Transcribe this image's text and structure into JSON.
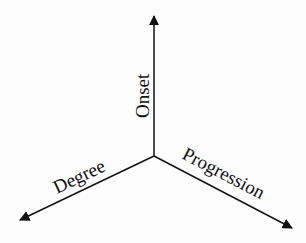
{
  "diagram": {
    "type": "three-axis-diagram",
    "center": {
      "x": 154,
      "y": 156
    },
    "axes": [
      {
        "label": "Onset",
        "direction": "up",
        "tip": {
          "x": 154,
          "y": 14
        }
      },
      {
        "label": "Degree",
        "direction": "down-left",
        "tip": {
          "x": 18,
          "y": 221
        }
      },
      {
        "label": "Progression",
        "direction": "down-right",
        "tip": {
          "x": 294,
          "y": 229
        }
      }
    ],
    "colors": {
      "line": "#111111",
      "background": "#fdfdfd"
    }
  }
}
